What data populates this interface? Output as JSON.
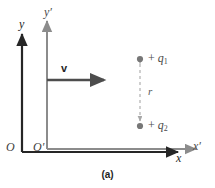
{
  "figure": {
    "caption": "(a)",
    "frames": {
      "unprimed": {
        "origin_label": "O",
        "y_axis_label": "y",
        "x_axis_label": "x",
        "color": "#262626"
      },
      "primed": {
        "origin_label": "O′",
        "y_axis_label": "y′",
        "x_axis_label": "x′",
        "color": "#8c8c8c"
      }
    },
    "velocity": {
      "label": "v",
      "color": "#4d4d4d"
    },
    "charges": [
      {
        "name": "charge-q1",
        "sign": "+",
        "symbol": "q",
        "subscript": "1",
        "label": "+ q1",
        "color": "#777777"
      },
      {
        "name": "charge-q2",
        "sign": "+",
        "symbol": "q",
        "subscript": "2",
        "label": "+ q2",
        "color": "#777777"
      }
    ],
    "separation": {
      "label": "r",
      "style": "dashed-double-arrow",
      "color": "#a8a8a8"
    }
  }
}
